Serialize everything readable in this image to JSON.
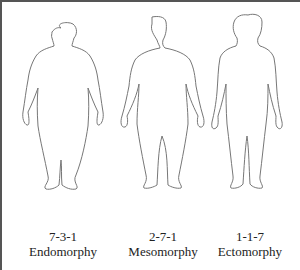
{
  "figures": [
    {
      "code": "7-3-1",
      "name": "Endomorphy"
    },
    {
      "code": "2-7-1",
      "name": "Mesomorphy"
    },
    {
      "code": "1-1-7",
      "name": "Ectomorphy"
    }
  ],
  "colors": {
    "outline": "#777777",
    "border": "#555555",
    "text": "#222222"
  }
}
